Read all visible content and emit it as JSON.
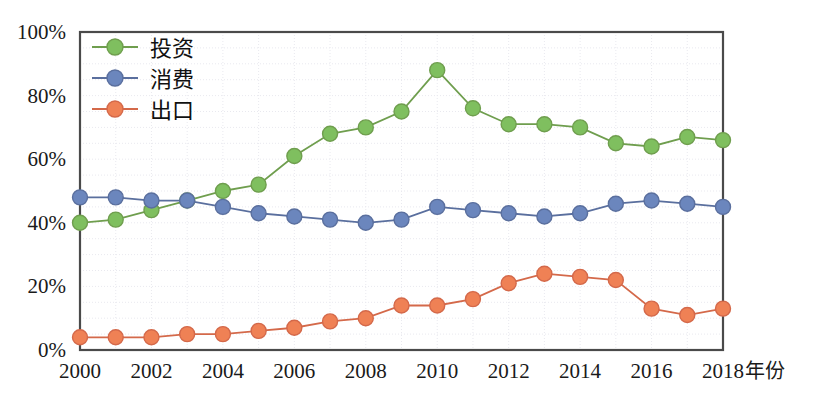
{
  "chart_data": {
    "type": "line",
    "title": "",
    "subtitle": "",
    "xlabel": "年份",
    "ylabel": "",
    "x": [
      2000,
      2001,
      2002,
      2003,
      2004,
      2005,
      2006,
      2007,
      2008,
      2009,
      2010,
      2011,
      2012,
      2013,
      2014,
      2015,
      2016,
      2017,
      2018
    ],
    "xtick_labels": [
      "2000",
      "2002",
      "2004",
      "2006",
      "2008",
      "2010",
      "2012",
      "2014",
      "2016",
      "2018"
    ],
    "xtick_values": [
      2000,
      2002,
      2004,
      2006,
      2008,
      2010,
      2012,
      2014,
      2016,
      2018
    ],
    "ytick_labels": [
      "0%",
      "20%",
      "40%",
      "60%",
      "80%",
      "100%"
    ],
    "ytick_values": [
      0,
      20,
      40,
      60,
      80,
      100
    ],
    "xlim": [
      2000,
      2018
    ],
    "ylim": [
      0,
      100
    ],
    "grid": true,
    "legend_position": "top-left-inside",
    "series": [
      {
        "name": "投资",
        "color": "#7fbf5f",
        "line_color": "#6f9e4e",
        "values": [
          40,
          41,
          44,
          47,
          50,
          52,
          61,
          68,
          70,
          75,
          88,
          76,
          71,
          71,
          70,
          65,
          64,
          67,
          66
        ]
      },
      {
        "name": "消费",
        "color": "#6b86bd",
        "line_color": "#5a6f9e",
        "values": [
          48,
          48,
          47,
          47,
          45,
          43,
          42,
          41,
          40,
          41,
          45,
          44,
          43,
          42,
          43,
          46,
          47,
          46,
          45
        ]
      },
      {
        "name": "出口",
        "color": "#ef8155",
        "line_color": "#d4694a",
        "values": [
          4,
          4,
          4,
          5,
          5,
          6,
          7,
          9,
          10,
          14,
          14,
          16,
          21,
          24,
          23,
          22,
          13,
          11,
          13
        ]
      }
    ]
  },
  "legend": {
    "items": [
      {
        "label": "投资",
        "color": "#7fbf5f",
        "line_color": "#6f9e4e"
      },
      {
        "label": "消费",
        "color": "#6b86bd",
        "line_color": "#5a6f9e"
      },
      {
        "label": "出口",
        "color": "#ef8155",
        "line_color": "#d4694a"
      }
    ]
  },
  "axes": {
    "x_axis_title": "年份"
  }
}
